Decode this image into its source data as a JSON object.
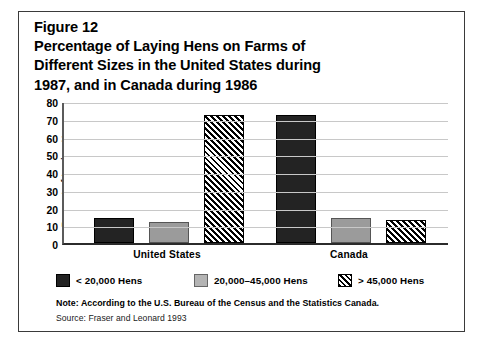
{
  "figure": {
    "title_lines": [
      "Figure 12",
      "Percentage of Laying Hens on Farms of",
      "Different Sizes in the United States during",
      "1987, and in Canada during 1986"
    ],
    "note": "Note: According to the U.S. Bureau of the Census and the Statistics Canada.",
    "source": "Source: Fraser and Leonard 1993"
  },
  "chart_data": {
    "type": "bar",
    "title": "Percentage of Laying Hens on Farms of Different Sizes in the United States during 1987, and in Canada during 1986",
    "xlabel": "",
    "ylabel": "Percent of Laying Hens",
    "categories": [
      "United States",
      "Canada"
    ],
    "series": [
      {
        "name": "< 20,000 Hens",
        "values": [
          14,
          72
        ],
        "style": "solid-dark",
        "color": "#232323"
      },
      {
        "name": "20,000–45,000 Hens",
        "values": [
          12,
          14
        ],
        "style": "solid-gray",
        "color": "#9b9b9b"
      },
      {
        "name": "> 45,000 Hens",
        "values": [
          72,
          13
        ],
        "style": "hatched",
        "color": "#000000"
      }
    ],
    "ylim": [
      0,
      80
    ],
    "yticks": [
      0,
      10,
      20,
      30,
      40,
      50,
      60,
      70,
      80
    ],
    "ytick_labels": [
      "0",
      "10",
      "20",
      "30",
      "40",
      "50",
      "60",
      "70",
      "80"
    ],
    "grid": true,
    "legend_position": "bottom"
  }
}
